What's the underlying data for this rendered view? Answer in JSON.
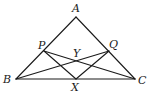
{
  "diagram": {
    "type": "geometry",
    "points": {
      "A": {
        "label": "A",
        "x": 76,
        "y": 17
      },
      "B": {
        "label": "B",
        "x": 16,
        "y": 79
      },
      "C": {
        "label": "C",
        "x": 135,
        "y": 79
      },
      "P": {
        "label": "P",
        "x": 44,
        "y": 51
      },
      "Q": {
        "label": "Q",
        "x": 109,
        "y": 51
      },
      "X": {
        "label": "X",
        "x": 76,
        "y": 79
      },
      "Y": {
        "label": "Y",
        "x": 76,
        "y": 62
      }
    },
    "segments": [
      [
        "A",
        "B"
      ],
      [
        "A",
        "C"
      ],
      [
        "B",
        "C"
      ],
      [
        "P",
        "C"
      ],
      [
        "Q",
        "B"
      ],
      [
        "P",
        "X"
      ],
      [
        "Q",
        "X"
      ]
    ],
    "labels": {
      "A": "A",
      "B": "B",
      "C": "C",
      "P": "P",
      "Q": "Q",
      "X": "X",
      "Y": "Y"
    },
    "stroke_color": "#1a1a1a"
  }
}
